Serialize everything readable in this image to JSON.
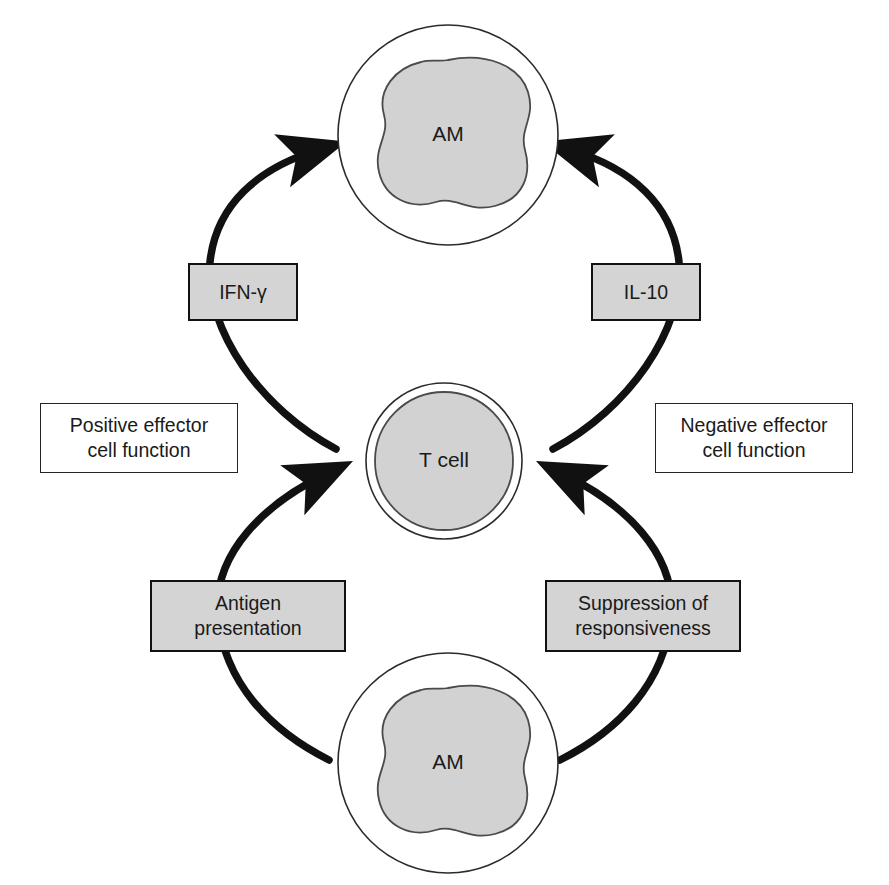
{
  "diagram": {
    "colors": {
      "cell_fill": "#d2d2d2",
      "box_fill": "#d4d4d4",
      "outline": "#2b2b2b",
      "arrow": "#111111",
      "text": "#1a1a1a",
      "background": "#ffffff"
    },
    "cells": [
      {
        "id": "am-top",
        "label": "AM",
        "role": "alveolar-macrophage",
        "position": "top"
      },
      {
        "id": "t-cell",
        "label": "T cell",
        "role": "t-lymphocyte",
        "position": "center"
      },
      {
        "id": "am-bottom",
        "label": "AM",
        "role": "alveolar-macrophage",
        "position": "bottom"
      }
    ],
    "mediators": [
      {
        "id": "ifn-gamma",
        "label": "IFN-γ",
        "side": "left",
        "arc": "upper"
      },
      {
        "id": "il-10",
        "label": "IL-10",
        "side": "right",
        "arc": "upper"
      }
    ],
    "processes": [
      {
        "id": "antigen-presentation",
        "line1": "Antigen",
        "line2": "presentation",
        "side": "left",
        "arc": "lower"
      },
      {
        "id": "suppression-of-responsiveness",
        "line1": "Suppression of",
        "line2": "responsiveness",
        "side": "right",
        "arc": "lower"
      }
    ],
    "annotations": [
      {
        "id": "positive-effector",
        "line1": "Positive effector",
        "line2": "cell function",
        "side": "left"
      },
      {
        "id": "negative-effector",
        "line1": "Negative effector",
        "line2": "cell function",
        "side": "right"
      }
    ],
    "arrows": [
      {
        "id": "arrow-tcell-to-am-top-left",
        "from": "t-cell",
        "to": "am-top",
        "via": "ifn-gamma",
        "direction": "up",
        "side": "left"
      },
      {
        "id": "arrow-tcell-to-am-top-right",
        "from": "t-cell",
        "to": "am-top",
        "via": "il-10",
        "direction": "up",
        "side": "right"
      },
      {
        "id": "arrow-am-bottom-to-tcell-left",
        "from": "am-bottom",
        "to": "t-cell",
        "via": "antigen-presentation",
        "direction": "up",
        "side": "left"
      },
      {
        "id": "arrow-am-bottom-to-tcell-right",
        "from": "am-bottom",
        "to": "t-cell",
        "via": "suppression-of-responsiveness",
        "direction": "up",
        "side": "right"
      }
    ]
  }
}
